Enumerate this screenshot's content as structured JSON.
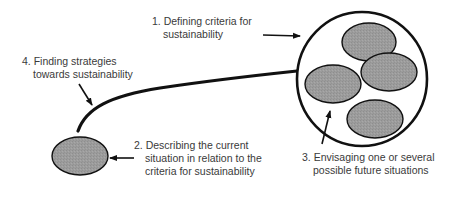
{
  "diagram": {
    "steps": [
      {
        "number": "1.",
        "lines": [
          "1. Defining criteria for",
          "sustainability"
        ]
      },
      {
        "number": "2.",
        "lines": [
          "2. Describing the current",
          "situation in relation to the",
          "criteria for sustainability"
        ]
      },
      {
        "number": "3.",
        "lines": [
          "3. Envisaging one or several",
          "possible future situations"
        ]
      },
      {
        "number": "4.",
        "lines": [
          "4. Finding strategies",
          "towards sustainability"
        ]
      }
    ],
    "shapes": {
      "current_situation": {
        "type": "ellipse",
        "fill": "#9a9a9a"
      },
      "future_situations_container": {
        "type": "circle",
        "fill": "#ffffff"
      },
      "future_situations": [
        {
          "type": "ellipse",
          "fill": "#9a9a9a"
        },
        {
          "type": "ellipse",
          "fill": "#9a9a9a"
        },
        {
          "type": "ellipse",
          "fill": "#9a9a9a"
        },
        {
          "type": "ellipse",
          "fill": "#9a9a9a"
        }
      ]
    },
    "colors": {
      "stroke": "#111111",
      "ellipse_fill": "#9a9a9a",
      "text": "#3a3a3a",
      "background": "#ffffff"
    }
  }
}
